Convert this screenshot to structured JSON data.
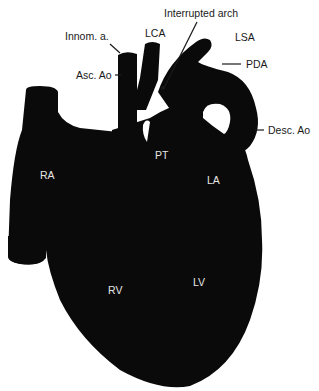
{
  "figure": {
    "colors": {
      "heart": "#0a0a0a",
      "background": "#ffffff",
      "outside_label": "#1a1a1a",
      "inside_label": "#e6e6e6"
    },
    "outside_labels": {
      "innom": "Innom. a.",
      "lca": "LCA",
      "asc_ao": "Asc. Ao",
      "interrupted_arch": "Interrupted arch",
      "lsa": "LSA",
      "pda": "PDA",
      "desc_ao": "Desc. Ao"
    },
    "inside_labels": {
      "pt": "PT",
      "ra": "RA",
      "la": "LA",
      "rv": "RV",
      "lv": "LV"
    }
  }
}
